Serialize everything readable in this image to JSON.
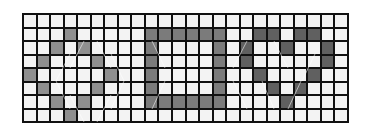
{
  "grid": {
    "columns": 24,
    "rows": 8,
    "colors": {
      "empty": "#f3f3f3",
      "line": "#111111",
      "diamond": "#8f8f8f",
      "rectangle": "#7b7b7b",
      "heart": "#606060"
    },
    "shapes": [
      {
        "name": "diamond",
        "shade": "s1",
        "cells": [
          [
            1,
            3
          ],
          [
            2,
            2
          ],
          [
            2,
            4
          ],
          [
            3,
            1
          ],
          [
            3,
            5
          ],
          [
            4,
            0
          ],
          [
            4,
            6
          ],
          [
            5,
            1
          ],
          [
            5,
            5
          ],
          [
            6,
            2
          ],
          [
            6,
            4
          ],
          [
            7,
            3
          ]
        ]
      },
      {
        "name": "rectangle",
        "shade": "s2",
        "cells": [
          [
            1,
            9
          ],
          [
            1,
            10
          ],
          [
            1,
            11
          ],
          [
            1,
            12
          ],
          [
            1,
            13
          ],
          [
            1,
            14
          ],
          [
            2,
            9
          ],
          [
            2,
            14
          ],
          [
            3,
            9
          ],
          [
            3,
            14
          ],
          [
            4,
            9
          ],
          [
            4,
            14
          ],
          [
            5,
            9
          ],
          [
            5,
            14
          ],
          [
            6,
            9
          ],
          [
            6,
            10
          ],
          [
            6,
            11
          ],
          [
            6,
            12
          ],
          [
            6,
            13
          ],
          [
            6,
            14
          ]
        ]
      },
      {
        "name": "heart",
        "shade": "s3",
        "cells": [
          [
            1,
            17
          ],
          [
            1,
            18
          ],
          [
            1,
            20
          ],
          [
            1,
            21
          ],
          [
            2,
            16
          ],
          [
            2,
            19
          ],
          [
            2,
            22
          ],
          [
            3,
            16
          ],
          [
            3,
            22
          ],
          [
            4,
            17
          ],
          [
            4,
            21
          ],
          [
            5,
            18
          ],
          [
            5,
            20
          ],
          [
            6,
            19
          ]
        ]
      }
    ]
  }
}
